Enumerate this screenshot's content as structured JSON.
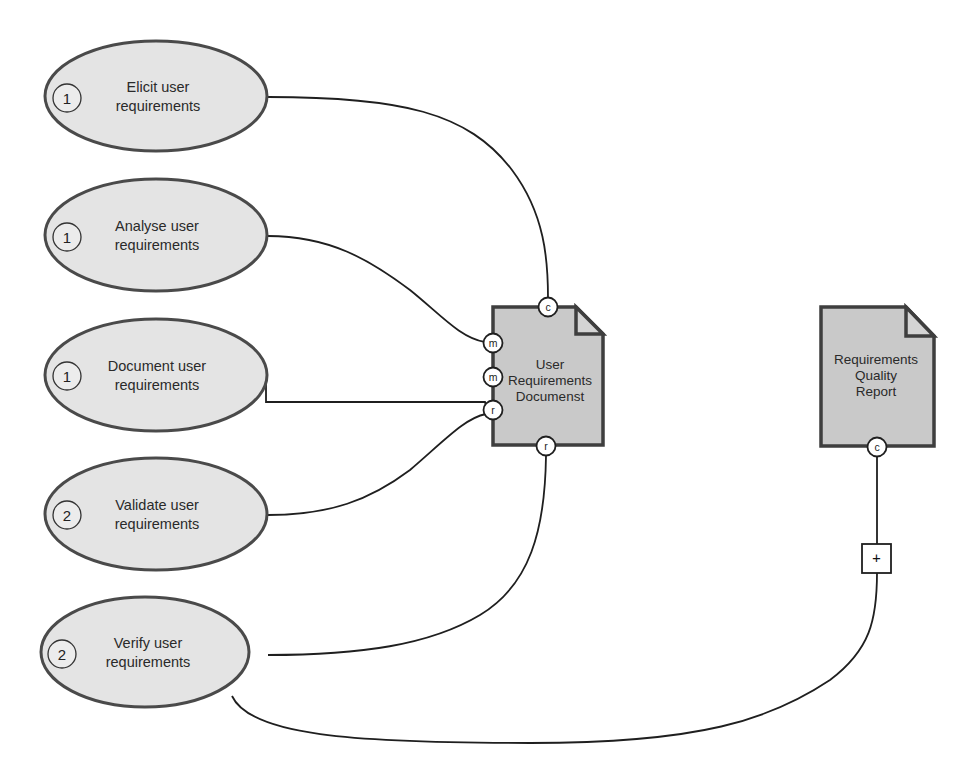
{
  "diagram": {
    "activities": [
      {
        "id": "elicit",
        "sequence": "1",
        "label_line1": "Elicit user",
        "label_line2": "requirements",
        "cx": 156,
        "cy": 96
      },
      {
        "id": "analyse",
        "sequence": "1",
        "label_line1": "Analyse user",
        "label_line2": "requirements",
        "cx": 156,
        "cy": 235
      },
      {
        "id": "document",
        "sequence": "1",
        "label_line1": "Document user",
        "label_line2": "requirements",
        "cx": 156,
        "cy": 375
      },
      {
        "id": "validate",
        "sequence": "2",
        "label_line1": "Validate user",
        "label_line2": "requirements",
        "cx": 156,
        "cy": 513
      },
      {
        "id": "verify",
        "sequence": "2",
        "label_line1": "Verify user",
        "label_line2": "requirements",
        "cx": 156,
        "cy": 652
      }
    ],
    "artifacts": [
      {
        "id": "urd",
        "label_line1": "User",
        "label_line2": "Requirements",
        "label_line3": "Documenst"
      },
      {
        "id": "rqr",
        "label_line1": "Requirements",
        "label_line2": "Quality",
        "label_line3": "Report"
      }
    ],
    "ports": {
      "urd_top": "c",
      "urd_left_1": "m",
      "urd_left_2": "m",
      "urd_left_3": "r",
      "urd_bottom": "r",
      "rqr_bottom": "c"
    },
    "connector_box": {
      "symbol": "+"
    },
    "relations": [
      {
        "from": "elicit",
        "to": "urd",
        "port": "c"
      },
      {
        "from": "analyse",
        "to": "urd",
        "port": "m"
      },
      {
        "from": "document",
        "to": "urd",
        "port": "r"
      },
      {
        "from": "validate",
        "to": "urd",
        "port": "r"
      },
      {
        "from": "verify",
        "to": "urd",
        "port": "r"
      },
      {
        "from": "verify",
        "to": "rqr",
        "port": "c",
        "via": "+"
      }
    ],
    "colors": {
      "activity_fill": "#e4e4e4",
      "activity_stroke": "#4a4a4a",
      "document_fill": "#c9c9c9",
      "document_stroke": "#3e3e3e",
      "line": "#1f1f1f",
      "background": "#ffffff"
    }
  }
}
